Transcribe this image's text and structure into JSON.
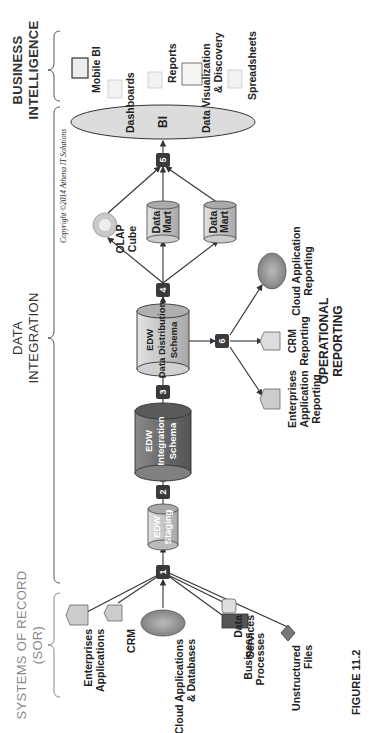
{
  "sections": {
    "sor": {
      "title_line1": "Systems of Record",
      "title_line2": "(SOR)"
    },
    "data_integration": {
      "title_line1": "Data",
      "title_line2": "Integration"
    },
    "business_intelligence": {
      "title_line1": "Business",
      "title_line2": "Intelligence"
    }
  },
  "sources": [
    {
      "id": "enterprise-apps",
      "line1": "Enterprises",
      "line2": "Applications"
    },
    {
      "id": "crm",
      "line1": "CRM",
      "line2": ""
    },
    {
      "id": "cloud-apps",
      "line1": "Cloud Applications",
      "line2": "& Databases"
    },
    {
      "id": "business-processes",
      "line1": "Business",
      "line2": "Processes"
    },
    {
      "id": "data-services",
      "line1": "Data",
      "line2": "Services"
    },
    {
      "id": "unstructured-files",
      "line1": "Unstructured",
      "line2": "Files"
    }
  ],
  "steps": [
    "1",
    "2",
    "3",
    "4",
    "5",
    "6"
  ],
  "stores": {
    "staging": {
      "line1": "EDW",
      "line2": "Staging"
    },
    "integration": {
      "line1": "EDW",
      "line2": "Integration",
      "line3": "Schema"
    },
    "distribution": {
      "line1": "EDW",
      "line2": "Data Distribution",
      "line3": "Schema"
    },
    "olap": {
      "line1": "OLAP",
      "line2": "Cube"
    },
    "mart1": {
      "line1": "Data",
      "line2": "Mart"
    },
    "mart2": {
      "line1": "Data",
      "line2": "Mart"
    },
    "bi": {
      "label": "BI"
    }
  },
  "bi_outputs": [
    {
      "id": "mobile-bi",
      "line1": "Mobile BI",
      "line2": ""
    },
    {
      "id": "dashboards",
      "line1": "Dashboards",
      "line2": ""
    },
    {
      "id": "reports",
      "line1": "Reports",
      "line2": ""
    },
    {
      "id": "data-viz",
      "line1": "Data Visualization",
      "line2": "& Discovery"
    },
    {
      "id": "spreadsheets",
      "line1": "Spreadsheets",
      "line2": ""
    }
  ],
  "operational_reporting": {
    "title_line1": "Operational",
    "title_line2": "Reporting",
    "items": [
      {
        "id": "ent-app-reporting",
        "line1": "Enterprises",
        "line2": "Application",
        "line3": "Reporting"
      },
      {
        "id": "crm-reporting",
        "line1": "CRM",
        "line2": "Reporting",
        "line3": ""
      },
      {
        "id": "cloud-app-reporting",
        "line1": "Cloud Application",
        "line2": "Reporting",
        "line3": ""
      }
    ]
  },
  "copyright": "Copyright ©2014 Athena IT Solutions",
  "figure_caption": "FIGURE 11.2",
  "colors": {
    "step_box": "#3a3a3a",
    "store_light": "#c8c8c8",
    "store_dark": "#6e6e6e",
    "bi_ellipse": "#dcdcdc",
    "line": "#333333"
  }
}
